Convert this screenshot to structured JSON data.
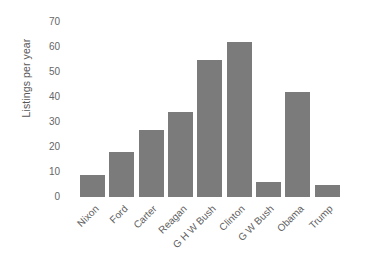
{
  "chart_data": {
    "type": "bar",
    "title": "",
    "xlabel": "",
    "ylabel": "Listings per year",
    "categories": [
      "Nixon",
      "Ford",
      "Carter",
      "Reagan",
      "G H W Bush",
      "Clinton",
      "G W Bush",
      "Obama",
      "Trump"
    ],
    "values": [
      9,
      18,
      27,
      34,
      55,
      62,
      6,
      42,
      5
    ],
    "ylim": [
      0,
      70
    ],
    "yticks": [
      0,
      10,
      20,
      30,
      40,
      50,
      60,
      70
    ],
    "ytick_labels": [
      "0",
      "10",
      "20",
      "30",
      "40",
      "50",
      "60",
      "70"
    ],
    "grid": false,
    "legend": false,
    "bar_color": "#7b7b7b",
    "background_color": "#ffffff",
    "text_color": "#5f5f5f"
  }
}
